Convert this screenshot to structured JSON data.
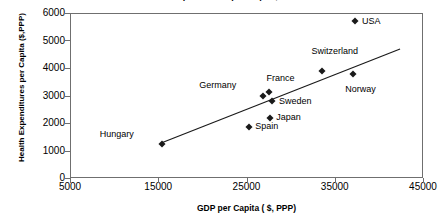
{
  "chart_data": {
    "type": "scatter",
    "title": "Health Expenditures per Capita, 2000",
    "xlabel": "GDP per Capita ( $, PPP)",
    "ylabel": "Health Expenditures per Capita ($,PPP)",
    "xlim": [
      5000,
      45000
    ],
    "ylim": [
      0,
      6000
    ],
    "xticks": [
      "5000",
      "15000",
      "25000",
      "35000",
      "45000"
    ],
    "xtick_values": [
      5000,
      15000,
      25000,
      35000,
      45000
    ],
    "yticks": [
      "0",
      "1000",
      "2000",
      "3000",
      "4000",
      "5000",
      "6000"
    ],
    "ytick_values": [
      0,
      1000,
      2000,
      3000,
      4000,
      5000,
      6000
    ],
    "grid": false,
    "legend": false,
    "marker_style": "filled-diamond",
    "marker_color": "#1a1a1a",
    "trendline": {
      "visible": true,
      "color": "#1a1a1a",
      "x_start": 15400,
      "y_start": 1280,
      "x_end": 42400,
      "y_end": 4690
    },
    "points": [
      {
        "label": "Hungary",
        "x": 15400,
        "y": 1250,
        "label_dx": -62,
        "label_dy": -10
      },
      {
        "label": "Spain",
        "x": 25300,
        "y": 1850,
        "label_dx": 6,
        "label_dy": -1
      },
      {
        "label": "Japan",
        "x": 27700,
        "y": 2200,
        "label_dx": 6,
        "label_dy": -1
      },
      {
        "label": "Germany",
        "x": 26900,
        "y": 3000,
        "label_dx": -64,
        "label_dy": -11
      },
      {
        "label": "France",
        "x": 27500,
        "y": 3120,
        "label_dx": -2,
        "label_dy": -14
      },
      {
        "label": "Sweden",
        "x": 27900,
        "y": 2800,
        "label_dx": 7,
        "label_dy": 0
      },
      {
        "label": "Switzerland",
        "x": 33500,
        "y": 3900,
        "label_dx": -10,
        "label_dy": -20
      },
      {
        "label": "Norway",
        "x": 37100,
        "y": 3800,
        "label_dx": -8,
        "label_dy": 15
      },
      {
        "label": "USA",
        "x": 37300,
        "y": 5700,
        "label_dx": 7,
        "label_dy": 0
      }
    ]
  }
}
